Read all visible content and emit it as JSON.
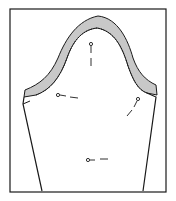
{
  "diagram": {
    "colors": {
      "line": "#1a1a1a",
      "seam_fill": "#c8c8c8",
      "background": "#ffffff"
    },
    "elements": [
      {
        "type": "frame",
        "label": "border"
      },
      {
        "type": "pattern-piece",
        "label": "sleeve"
      },
      {
        "type": "seam-allowance",
        "label": "cap seam allowance"
      },
      {
        "type": "pin",
        "count": 4
      }
    ]
  }
}
